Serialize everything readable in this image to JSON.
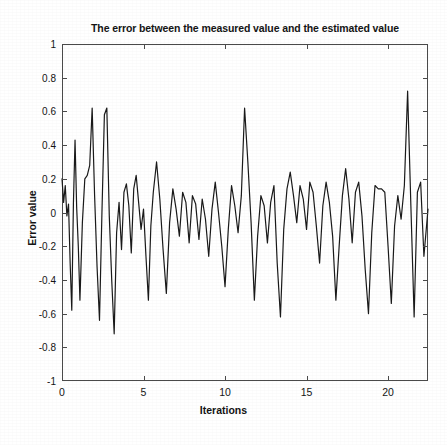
{
  "chart_data": {
    "type": "line",
    "title": "The error between the measured value and the estimated value",
    "xlabel": "Iterations",
    "ylabel": "Error value",
    "xlim": [
      0,
      22.45
    ],
    "ylim": [
      -1,
      1
    ],
    "xticks": [
      0,
      5,
      10,
      15,
      20
    ],
    "xtick_labels": [
      "0",
      "5",
      "10",
      "15",
      "20"
    ],
    "yticks": [
      -1,
      -0.8,
      -0.6,
      -0.4,
      -0.2,
      0,
      0.2,
      0.4,
      0.6,
      0.8,
      1
    ],
    "ytick_labels": [
      "-1",
      "-0.8",
      "-0.6",
      "-0.4",
      "-0.2",
      "0",
      "0.2",
      "0.4",
      "0.6",
      "0.8",
      "1"
    ],
    "grid": false,
    "legend": null,
    "line_color": "#1a1a1a",
    "line_width": 1.2,
    "series": [
      {
        "name": "error",
        "x": [
          0.0,
          0.1,
          0.2,
          0.3,
          0.4,
          0.5,
          0.6,
          0.7,
          0.8,
          0.9,
          1.0,
          1.1,
          1.25,
          1.4,
          1.55,
          1.7,
          1.85,
          2.0,
          2.15,
          2.3,
          2.45,
          2.6,
          2.75,
          2.9,
          3.05,
          3.2,
          3.35,
          3.5,
          3.65,
          3.8,
          3.95,
          4.1,
          4.25,
          4.4,
          4.55,
          4.7,
          4.85,
          5.0,
          5.15,
          5.3,
          5.45,
          5.6,
          5.8,
          6.0,
          6.2,
          6.4,
          6.6,
          6.8,
          7.0,
          7.2,
          7.4,
          7.6,
          7.8,
          8.0,
          8.2,
          8.4,
          8.6,
          8.8,
          9.0,
          9.2,
          9.4,
          9.6,
          9.8,
          10.0,
          10.2,
          10.4,
          10.6,
          10.8,
          11.0,
          11.2,
          11.4,
          11.6,
          11.8,
          12.0,
          12.2,
          12.4,
          12.6,
          12.8,
          13.0,
          13.2,
          13.4,
          13.6,
          13.8,
          14.0,
          14.2,
          14.4,
          14.6,
          14.8,
          15.0,
          15.2,
          15.4,
          15.6,
          15.8,
          16.0,
          16.2,
          16.4,
          16.6,
          16.8,
          17.0,
          17.2,
          17.4,
          17.6,
          17.8,
          18.0,
          18.2,
          18.4,
          18.6,
          18.8,
          19.0,
          19.2,
          19.4,
          19.6,
          19.8,
          20.0,
          20.2,
          20.4,
          20.6,
          20.8,
          21.0,
          21.2,
          21.4,
          21.6,
          21.8,
          22.0,
          22.2,
          22.45
        ],
        "y": [
          0.2,
          0.06,
          0.16,
          -0.02,
          0.05,
          -0.3,
          -0.58,
          0.05,
          0.43,
          0.03,
          -0.2,
          -0.52,
          -0.06,
          0.2,
          0.22,
          0.28,
          0.62,
          0.1,
          -0.32,
          -0.64,
          0.0,
          0.58,
          0.62,
          -0.02,
          -0.4,
          -0.72,
          -0.12,
          0.06,
          -0.22,
          0.12,
          0.17,
          0.04,
          -0.24,
          0.14,
          0.22,
          0.06,
          -0.1,
          0.02,
          -0.26,
          -0.52,
          -0.08,
          0.12,
          0.3,
          0.08,
          -0.22,
          -0.48,
          -0.06,
          0.14,
          0.02,
          -0.14,
          0.12,
          0.06,
          -0.18,
          0.1,
          0.05,
          -0.16,
          0.08,
          -0.04,
          -0.26,
          0.02,
          0.18,
          0.0,
          -0.2,
          -0.44,
          -0.1,
          0.16,
          0.04,
          -0.12,
          0.1,
          0.62,
          0.3,
          -0.06,
          -0.52,
          -0.14,
          0.1,
          0.04,
          -0.18,
          0.06,
          0.16,
          -0.3,
          -0.62,
          -0.1,
          0.14,
          0.24,
          0.1,
          -0.06,
          0.16,
          0.08,
          -0.1,
          0.18,
          0.12,
          -0.08,
          -0.3,
          0.04,
          0.18,
          0.06,
          -0.14,
          -0.52,
          -0.2,
          0.1,
          0.26,
          0.08,
          -0.18,
          0.12,
          0.18,
          -0.02,
          -0.34,
          -0.6,
          -0.12,
          0.16,
          0.14,
          0.14,
          0.12,
          -0.2,
          -0.54,
          -0.08,
          0.1,
          -0.04,
          0.16,
          0.72,
          0.04,
          -0.62,
          0.12,
          0.18,
          -0.26,
          0.02
        ]
      }
    ]
  }
}
